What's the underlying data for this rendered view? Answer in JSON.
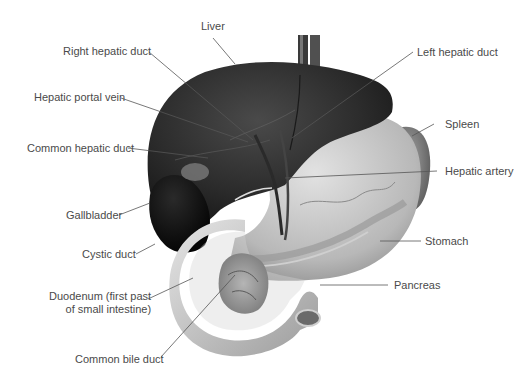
{
  "diagram": {
    "labels": {
      "liver": "Liver",
      "right_hepatic_duct": "Right hepatic duct",
      "left_hepatic_duct": "Left hepatic duct",
      "hepatic_portal_vein": "Hepatic portal vein",
      "spleen": "Spleen",
      "common_hepatic_duct": "Common hepatic duct",
      "hepatic_artery": "Hepatic artery",
      "gallbladder": "Gallbladder",
      "stomach": "Stomach",
      "cystic_duct": "Cystic duct",
      "duodenum_line1": "Duodenum (first past",
      "duodenum_line2": "of small intestine)",
      "pancreas": "Pancreas",
      "common_bile_duct": "Common bile duct"
    },
    "colors": {
      "background": "#ffffff",
      "label_text": "#4a4a4a",
      "leader_line": "#555555",
      "liver": "#2a2a2a",
      "stomach": "#bdbdbd",
      "duodenum": "#c8c8c8",
      "gallbladder": "#111111"
    }
  }
}
